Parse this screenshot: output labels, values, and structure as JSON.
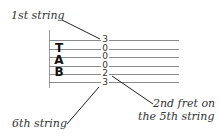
{
  "diagram": {
    "type": "guitar-tablature-explanation",
    "tab_letters": [
      "T",
      "A",
      "B"
    ],
    "frets": [
      {
        "string": 1,
        "fret": "3"
      },
      {
        "string": 2,
        "fret": "0"
      },
      {
        "string": 3,
        "fret": "0"
      },
      {
        "string": 4,
        "fret": "0"
      },
      {
        "string": 5,
        "fret": "2"
      },
      {
        "string": 6,
        "fret": "3"
      }
    ],
    "annotations": {
      "first_string": "1st string",
      "sixth_string": "6th string",
      "fret_note_line1": "2nd fret on",
      "fret_note_line2": "the 5th string"
    },
    "colors": {
      "lines": "#8a8a8a",
      "text": "#333333",
      "tab_letters": "#111111"
    }
  }
}
